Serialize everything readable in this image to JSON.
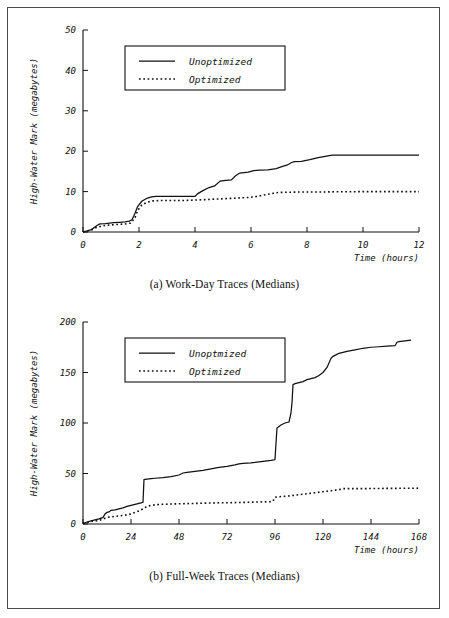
{
  "figure": {
    "panels": [
      {
        "id": "a",
        "caption": "(a) Work-Day Traces (Medians)",
        "legend": {
          "unoptimized_label": "Unoptimized",
          "optimized_label": "Optimized"
        }
      },
      {
        "id": "b",
        "caption": "(b) Full-Week Traces (Medians)",
        "legend": {
          "unoptimized_label": "Unoptmized",
          "optimized_label": "Optimized"
        }
      }
    ]
  },
  "chart_data": [
    {
      "type": "line",
      "title": "(a) Work-Day Traces (Medians)",
      "xlabel": "Time (hours)",
      "ylabel": "High-Water Mark (megabytes)",
      "xlim": [
        0,
        12
      ],
      "ylim": [
        0,
        50
      ],
      "xticks": [
        0,
        2,
        4,
        6,
        8,
        10,
        12
      ],
      "yticks": [
        0,
        10,
        20,
        30,
        40,
        50
      ],
      "grid": false,
      "legend_position": "upper-left",
      "series": [
        {
          "name": "Unoptimized",
          "style": "solid",
          "x": [
            0.0,
            0.3,
            0.5,
            0.6,
            0.8,
            0.95,
            1.1,
            1.3,
            1.5,
            1.65,
            1.75,
            1.85,
            1.95,
            2.1,
            2.3,
            2.45,
            2.6,
            3.0,
            3.5,
            4.0,
            4.1,
            4.3,
            4.5,
            4.7,
            4.9,
            5.1,
            5.3,
            5.45,
            5.6,
            5.9,
            6.1,
            6.3,
            6.6,
            6.9,
            7.1,
            7.3,
            7.45,
            7.55,
            7.8,
            8.1,
            8.4,
            8.7,
            8.9,
            9.1,
            9.5,
            10.0,
            11.0,
            12.0
          ],
          "y": [
            0.0,
            0.6,
            1.6,
            2.0,
            2.1,
            2.2,
            2.3,
            2.4,
            2.5,
            2.7,
            3.0,
            4.5,
            6.3,
            7.6,
            8.4,
            8.7,
            8.8,
            8.8,
            8.8,
            8.8,
            9.5,
            10.3,
            11.0,
            11.4,
            12.6,
            12.8,
            12.9,
            13.9,
            14.6,
            14.8,
            15.2,
            15.3,
            15.4,
            15.7,
            16.2,
            16.6,
            17.2,
            17.4,
            17.5,
            17.9,
            18.4,
            18.8,
            19.0,
            19.0,
            19.0,
            19.0,
            19.0,
            19.0
          ]
        },
        {
          "name": "Optimized",
          "style": "dotted",
          "x": [
            0.0,
            0.3,
            0.5,
            0.7,
            0.9,
            1.1,
            1.3,
            1.5,
            1.7,
            1.85,
            1.95,
            2.1,
            2.3,
            2.5,
            2.8,
            3.2,
            3.6,
            4.0,
            4.3,
            4.6,
            4.9,
            5.2,
            5.5,
            5.8,
            6.0,
            6.2,
            6.5,
            6.8,
            7.0,
            7.4,
            7.8,
            8.2,
            8.6,
            9.0,
            9.5,
            10.0,
            10.5,
            11.0,
            11.5,
            12.0
          ],
          "y": [
            0.0,
            0.5,
            1.2,
            1.5,
            1.7,
            1.8,
            1.9,
            2.0,
            2.2,
            3.4,
            5.3,
            6.7,
            7.4,
            7.7,
            7.8,
            7.8,
            7.8,
            7.9,
            8.0,
            8.1,
            8.2,
            8.3,
            8.4,
            8.5,
            8.6,
            8.8,
            9.2,
            9.6,
            9.8,
            9.85,
            9.9,
            9.9,
            9.9,
            9.95,
            9.95,
            10.0,
            10.0,
            10.0,
            10.0,
            10.0
          ]
        }
      ]
    },
    {
      "type": "line",
      "title": "(b) Full-Week Traces (Medians)",
      "xlabel": "Time (hours)",
      "ylabel": "High-Water Mark (megabytes)",
      "xlim": [
        0,
        168
      ],
      "ylim": [
        0,
        200
      ],
      "xticks": [
        0,
        24,
        48,
        72,
        96,
        120,
        144,
        168
      ],
      "yticks": [
        0,
        50,
        100,
        150,
        200
      ],
      "grid": false,
      "legend_position": "upper-left",
      "series": [
        {
          "name": "Unoptmized",
          "style": "solid",
          "x": [
            0,
            2,
            4,
            6,
            8,
            10,
            11,
            12,
            13,
            14,
            16,
            18,
            20,
            22,
            24,
            26,
            28,
            29,
            30,
            30.5,
            32,
            34,
            36,
            38,
            40,
            44,
            48,
            50,
            52,
            54,
            56,
            58,
            60,
            64,
            68,
            72,
            76,
            78,
            80,
            82,
            84,
            86,
            88,
            90,
            92,
            94,
            95.5,
            96,
            96.5,
            97,
            98,
            99,
            100,
            101,
            102,
            103,
            104,
            104.5,
            105,
            106,
            108,
            110,
            112,
            114,
            116,
            118,
            120,
            122,
            124,
            125,
            126,
            127,
            128,
            130,
            132,
            136,
            140,
            144,
            148,
            152,
            156,
            157,
            158,
            160,
            164,
            168
          ],
          "y": [
            0.5,
            2.0,
            3.0,
            4.0,
            5.0,
            6.5,
            10.0,
            11.5,
            12.0,
            13.5,
            14.0,
            15.0,
            16.0,
            17.5,
            18.5,
            19.5,
            20.5,
            21.0,
            21.5,
            44.0,
            44.5,
            45.0,
            45.3,
            45.6,
            46.0,
            47.0,
            48.5,
            50.5,
            51.0,
            51.5,
            52.0,
            52.5,
            53.0,
            54.5,
            56.0,
            57.0,
            58.5,
            59.5,
            60.0,
            60.3,
            60.6,
            61.0,
            61.5,
            62.0,
            62.5,
            63.0,
            63.5,
            64.0,
            80.0,
            95.0,
            96.5,
            98.0,
            99.0,
            100.0,
            100.5,
            101.0,
            110.0,
            120.0,
            138.0,
            139.0,
            140.0,
            141.0,
            143.0,
            144.0,
            145.0,
            147.0,
            150.0,
            155.0,
            164.0,
            166.0,
            167.0,
            168.0,
            169.0,
            170.0,
            171.0,
            172.5,
            174.0,
            175.0,
            175.5,
            176.0,
            176.5,
            180.0,
            180.5,
            181.0,
            182.0
          ]
        },
        {
          "name": "Optimized",
          "style": "dotted",
          "x": [
            0,
            2,
            4,
            6,
            8,
            10,
            12,
            14,
            16,
            18,
            20,
            22,
            24,
            26,
            28,
            30,
            32,
            34,
            36,
            40,
            44,
            48,
            52,
            56,
            60,
            64,
            68,
            72,
            76,
            80,
            84,
            88,
            92,
            94,
            95,
            96,
            98,
            100,
            102,
            104,
            106,
            108,
            110,
            112,
            114,
            116,
            118,
            120,
            122,
            124,
            126,
            128,
            129,
            130,
            134,
            140,
            148,
            156,
            164,
            168
          ],
          "y": [
            0.5,
            1.5,
            2.5,
            3.0,
            3.5,
            5.0,
            6.5,
            7.0,
            7.5,
            8.0,
            8.5,
            9.0,
            10.0,
            11.5,
            13.0,
            15.0,
            17.5,
            18.5,
            19.0,
            19.5,
            19.8,
            20.0,
            20.2,
            20.4,
            20.6,
            20.8,
            21.0,
            21.0,
            21.2,
            21.4,
            21.6,
            21.8,
            22.0,
            22.2,
            22.5,
            26.5,
            27.0,
            27.3,
            27.6,
            28.0,
            28.5,
            29.0,
            29.5,
            30.0,
            30.5,
            31.0,
            31.5,
            32.0,
            32.5,
            33.0,
            33.5,
            34.0,
            34.5,
            35.0,
            35.0,
            35.0,
            35.2,
            35.3,
            35.4,
            35.5
          ]
        }
      ]
    }
  ]
}
